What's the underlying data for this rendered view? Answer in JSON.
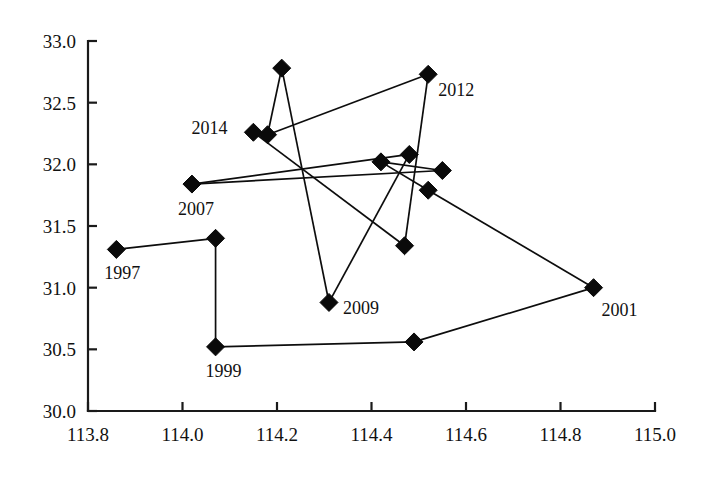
{
  "chart_data": {
    "type": "scatter",
    "title": "",
    "subtitle": "",
    "xlabel": "",
    "ylabel": "",
    "xlim": [
      113.8,
      115.0
    ],
    "ylim": [
      30.0,
      33.0
    ],
    "grid": false,
    "legend": null,
    "connected": true,
    "marker_style": "filled-diamond",
    "marker_color": "#0a0a0a",
    "line_color": "#0d0d0d",
    "x_ticks": [
      "113.8",
      "114.0",
      "114.2",
      "114.4",
      "114.6",
      "114.8",
      "115.0"
    ],
    "x_tick_values": [
      113.8,
      114.0,
      114.2,
      114.4,
      114.6,
      114.8,
      115.0
    ],
    "y_ticks": [
      "30.0",
      "30.5",
      "31.0",
      "31.5",
      "32.0",
      "32.5",
      "33.0"
    ],
    "y_tick_values": [
      30.0,
      30.5,
      31.0,
      31.5,
      32.0,
      32.5,
      33.0
    ],
    "points": [
      {
        "label": "1997",
        "x": 113.86,
        "y": 31.31,
        "label_dx": -12,
        "label_dy": 30,
        "label_anchor": "start"
      },
      {
        "label": "",
        "x": 114.07,
        "y": 31.4,
        "label_dx": 0,
        "label_dy": 0,
        "label_anchor": "start"
      },
      {
        "label": "1999",
        "x": 114.07,
        "y": 30.52,
        "label_dx": -10,
        "label_dy": 30,
        "label_anchor": "start"
      },
      {
        "label": "",
        "x": 114.49,
        "y": 30.56,
        "label_dx": 0,
        "label_dy": 0,
        "label_anchor": "start"
      },
      {
        "label": "2001",
        "x": 114.87,
        "y": 31.0,
        "label_dx": 8,
        "label_dy": 28,
        "label_anchor": "start"
      },
      {
        "label": "",
        "x": 114.52,
        "y": 31.79,
        "label_dx": 0,
        "label_dy": 0,
        "label_anchor": "start"
      },
      {
        "label": "",
        "x": 114.42,
        "y": 32.02,
        "label_dx": 0,
        "label_dy": 0,
        "label_anchor": "start"
      },
      {
        "label": "",
        "x": 114.55,
        "y": 31.95,
        "label_dx": 0,
        "label_dy": 0,
        "label_anchor": "start"
      },
      {
        "label": "2007",
        "x": 114.02,
        "y": 31.84,
        "label_dx": -14,
        "label_dy": 31,
        "label_anchor": "start"
      },
      {
        "label": "",
        "x": 114.48,
        "y": 32.08,
        "label_dx": 0,
        "label_dy": 0,
        "label_anchor": "start"
      },
      {
        "label": "2009",
        "x": 114.31,
        "y": 30.88,
        "label_dx": 14,
        "label_dy": 12,
        "label_anchor": "start"
      },
      {
        "label": "",
        "x": 114.21,
        "y": 32.78,
        "label_dx": 0,
        "label_dy": 0,
        "label_anchor": "start"
      },
      {
        "label": "",
        "x": 114.18,
        "y": 32.24,
        "label_dx": 0,
        "label_dy": 0,
        "label_anchor": "start"
      },
      {
        "label": "2012",
        "x": 114.52,
        "y": 32.73,
        "label_dx": 10,
        "label_dy": 22,
        "label_anchor": "start"
      },
      {
        "label": "",
        "x": 114.47,
        "y": 31.34,
        "label_dx": 0,
        "label_dy": 0,
        "label_anchor": "start"
      },
      {
        "label": "2014",
        "x": 114.15,
        "y": 32.26,
        "label_dx": -62,
        "label_dy": 2,
        "label_anchor": "start"
      }
    ],
    "path_order": [
      0,
      1,
      2,
      3,
      4,
      5,
      6,
      7,
      8,
      9,
      10,
      11,
      12,
      13,
      14,
      15
    ],
    "segments": [
      [
        113.86,
        31.31,
        114.07,
        31.4
      ],
      [
        114.07,
        31.4,
        114.07,
        30.52
      ],
      [
        114.07,
        30.52,
        114.49,
        30.56
      ],
      [
        114.49,
        30.56,
        114.87,
        31.0
      ],
      [
        114.87,
        31.0,
        114.52,
        31.79
      ],
      [
        114.52,
        31.79,
        114.42,
        32.02
      ],
      [
        114.42,
        32.02,
        114.55,
        31.95
      ],
      [
        114.55,
        31.95,
        114.02,
        31.84
      ],
      [
        114.02,
        31.84,
        114.48,
        32.08
      ],
      [
        114.48,
        32.08,
        114.31,
        30.88
      ],
      [
        114.31,
        30.88,
        114.21,
        32.78
      ],
      [
        114.21,
        32.78,
        114.18,
        32.24
      ],
      [
        114.18,
        32.24,
        114.52,
        32.73
      ],
      [
        114.52,
        32.73,
        114.47,
        31.34
      ],
      [
        114.47,
        31.34,
        114.15,
        32.26
      ]
    ]
  }
}
